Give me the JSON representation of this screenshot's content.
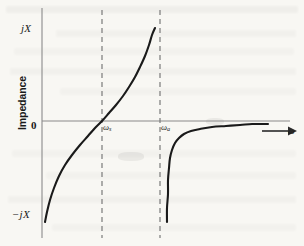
{
  "figure": {
    "background_color": "#f8f7f3",
    "axis_color": "#8a8a8a",
    "curve_color": "#1a1a1a",
    "dash_color": "#7a7a7a"
  },
  "labels": {
    "y_axis_title": "Impedance",
    "y_top": "jX",
    "y_bottom": "−jX",
    "origin": "0",
    "x_axis_symbol": "ω",
    "omega_s": "ω",
    "omega_s_sub": "s",
    "omega_a": "ω",
    "omega_a_sub": "a"
  },
  "chart_data": {
    "type": "line",
    "title": "",
    "xlabel": "ω",
    "ylabel": "Impedance",
    "grid": false,
    "legend": "none",
    "xlim": [
      0,
      1
    ],
    "ylim": [
      -1,
      1
    ],
    "ytick_labels": [
      "jX",
      "0",
      "−jX"
    ],
    "ytick_values": [
      1,
      0,
      -1
    ],
    "xtick_labels": [
      "ωs",
      "ωa"
    ],
    "annotations": [
      {
        "text": "ωs",
        "role": "series-resonance-frequency",
        "x_px": 102,
        "note": "impedance crosses zero"
      },
      {
        "text": "ωa",
        "role": "anti-resonance-frequency",
        "x_px": 160,
        "note": "impedance pole / asymptote"
      }
    ],
    "vertical_dashed_lines": [
      {
        "label": "ωs",
        "x_px": 102
      },
      {
        "label": "ωa",
        "x_px": 160
      }
    ],
    "series": [
      {
        "name": "branch-inductive-below-omega-a",
        "description": "Reactance rises from -jX at low frequency, crosses zero at ωs, diverges to +jX as ω approaches ωa",
        "points_px": [
          [
            45,
            222
          ],
          [
            47,
            212
          ],
          [
            50,
            200
          ],
          [
            54,
            188
          ],
          [
            59,
            176
          ],
          [
            65,
            165
          ],
          [
            72,
            155
          ],
          [
            80,
            145
          ],
          [
            88,
            136
          ],
          [
            95,
            128
          ],
          [
            102,
            121
          ],
          [
            109,
            113
          ],
          [
            116,
            105
          ],
          [
            123,
            96
          ],
          [
            129,
            87
          ],
          [
            135,
            77
          ],
          [
            140,
            67
          ],
          [
            145,
            56
          ],
          [
            149,
            45
          ],
          [
            152,
            35
          ],
          [
            155,
            28
          ]
        ]
      },
      {
        "name": "branch-capacitive-above-omega-a",
        "description": "Reactance emerges from -jX just above ωa and asymptotically approaches zero from below",
        "points_px": [
          [
            167,
            222
          ],
          [
            167,
            208
          ],
          [
            168,
            194
          ],
          [
            168,
            180
          ],
          [
            169,
            168
          ],
          [
            170,
            158
          ],
          [
            172,
            150
          ],
          [
            175,
            143
          ],
          [
            179,
            138
          ],
          [
            184,
            134
          ],
          [
            191,
            131
          ],
          [
            200,
            129
          ],
          [
            212,
            127
          ],
          [
            226,
            126
          ],
          [
            240,
            125
          ],
          [
            252,
            124
          ],
          [
            262,
            124
          ],
          [
            268,
            124
          ]
        ]
      }
    ],
    "axes": {
      "y_axis_x_px": 42,
      "y_axis_top_px": 8,
      "y_axis_bottom_px": 238,
      "x_axis_y_px": 121,
      "x_axis_left_px": 42,
      "x_axis_right_px": 296,
      "x_axis_has_arrow": true
    }
  }
}
